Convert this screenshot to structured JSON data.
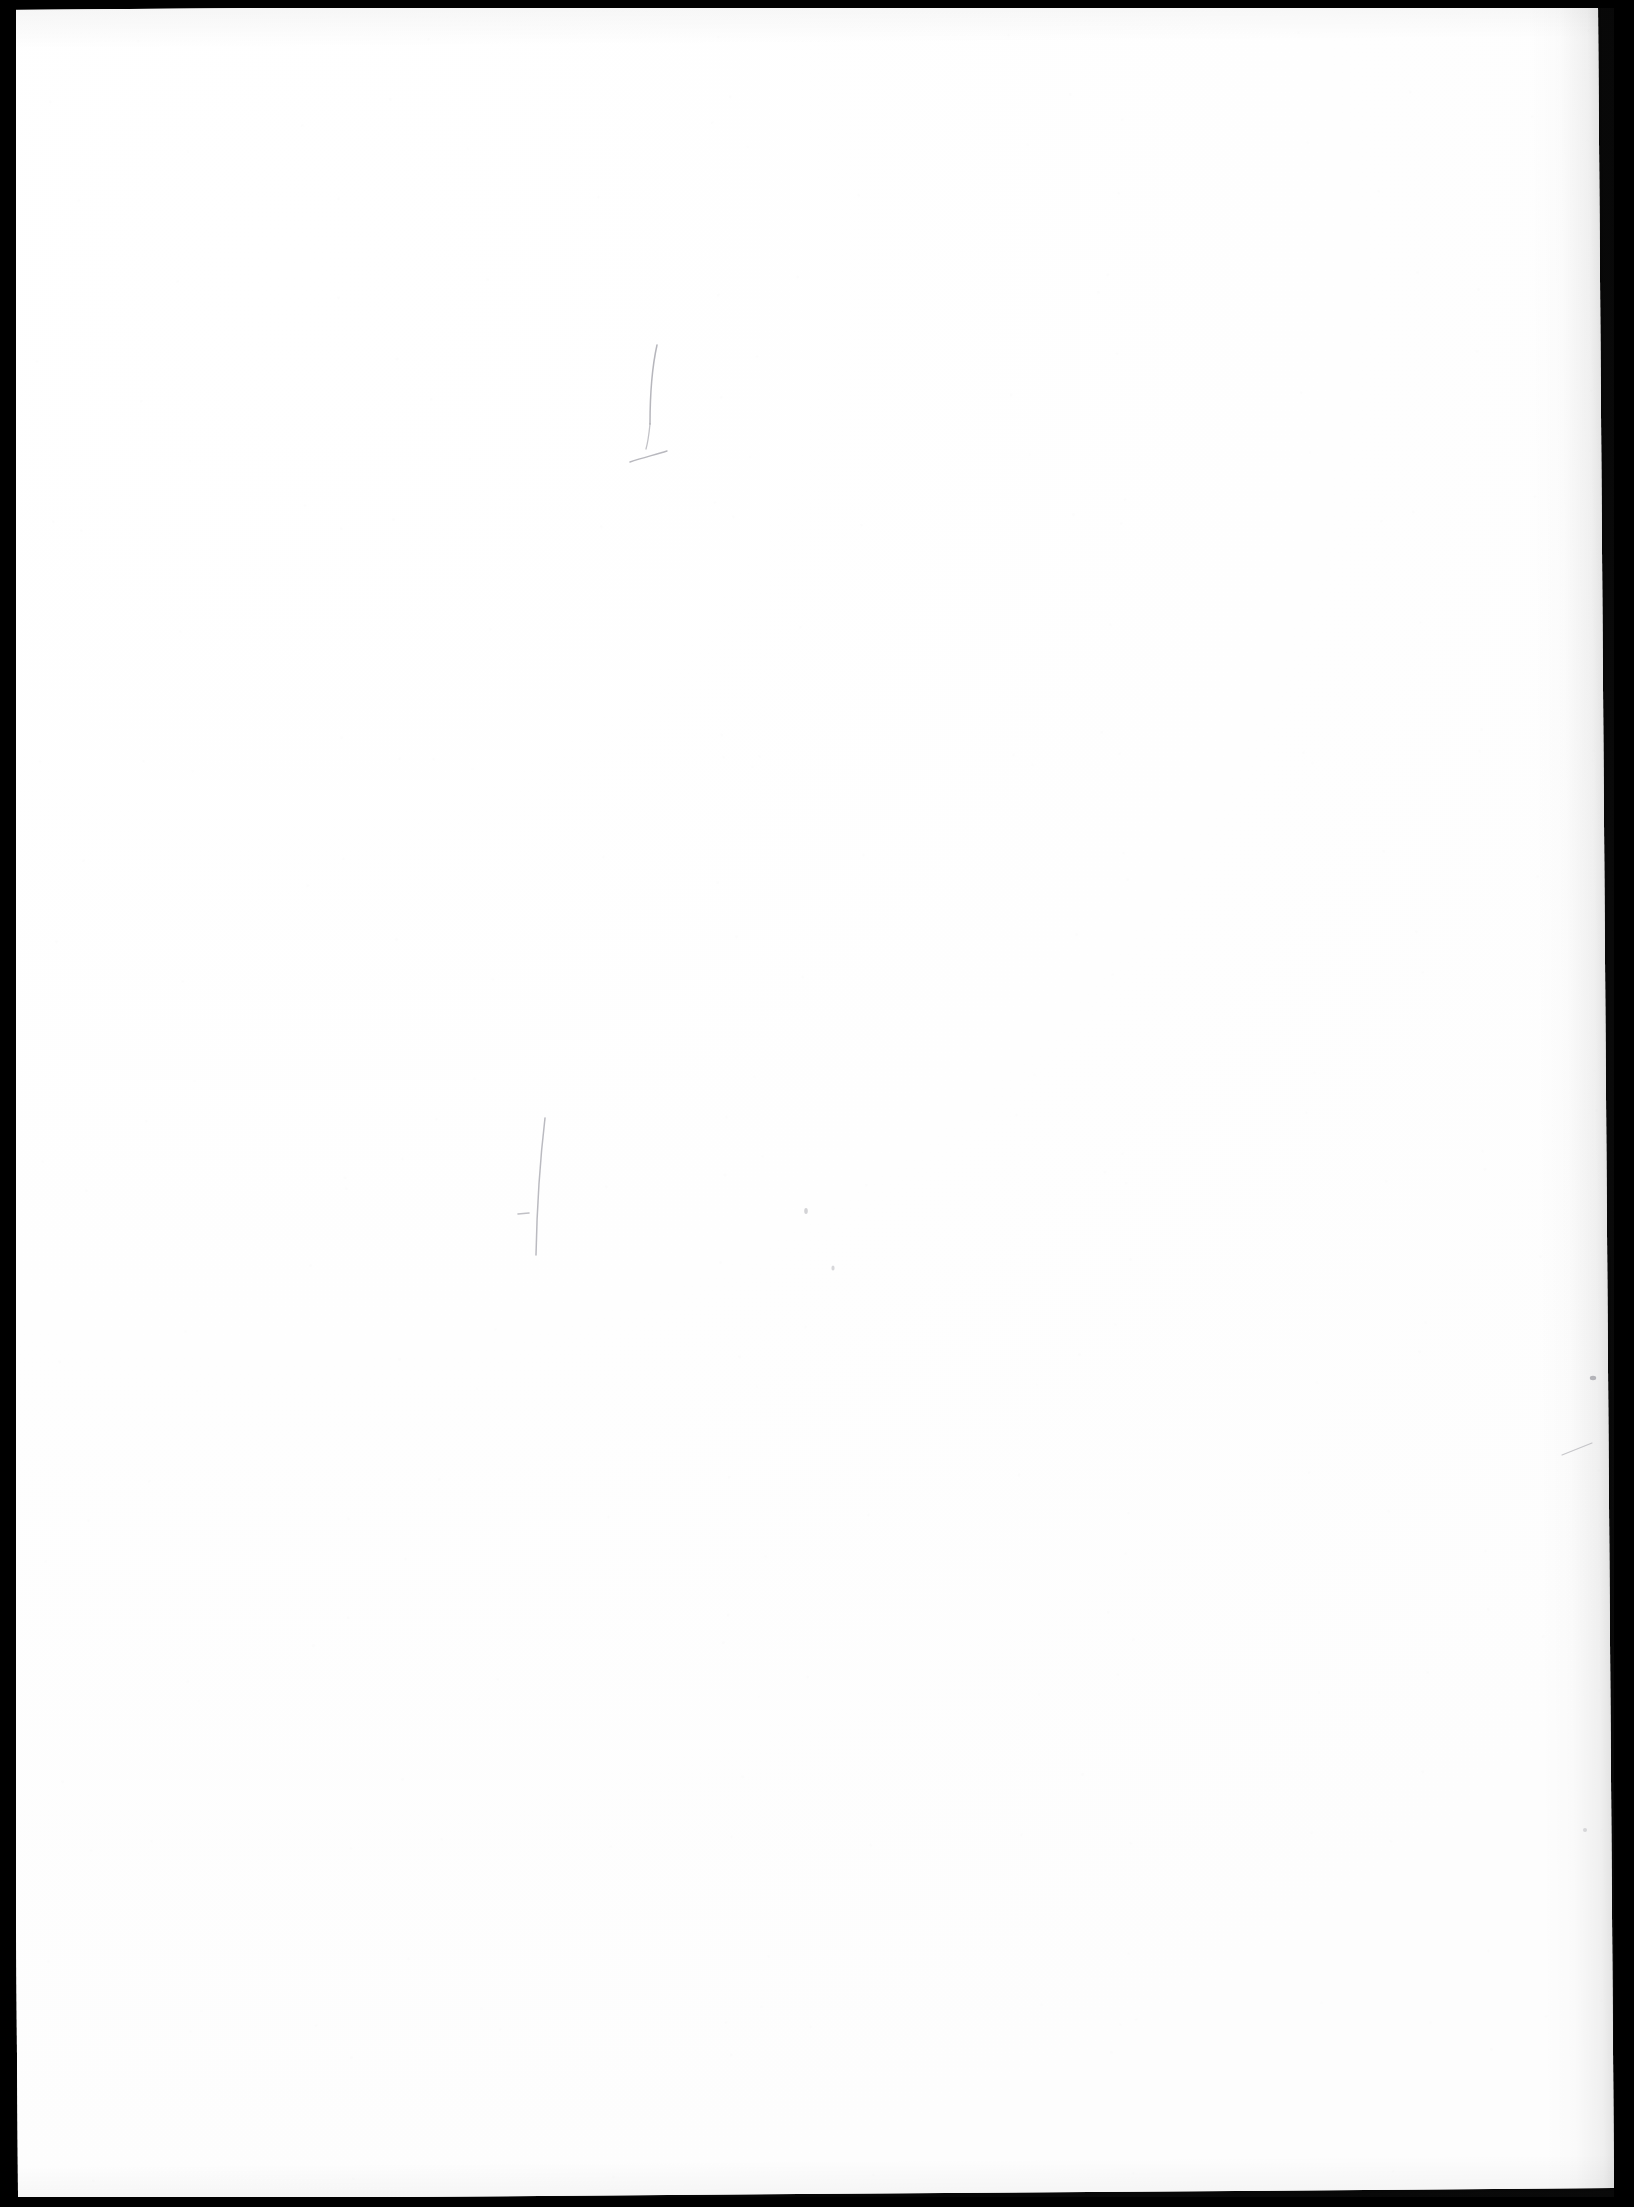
{
  "document": {
    "type": "scanned-page",
    "title": "Blank scanned sheet",
    "visible_text": "",
    "page_content_note": "No printed or legible handwritten text is present on this page.",
    "orientation": "portrait",
    "rotation_degrees": -0.42
  },
  "canvas": {
    "width": 1634,
    "height": 2207
  },
  "paper": {
    "left": 10,
    "top": 4,
    "width": 1596,
    "height": 2190,
    "fill_color": "#ffffff",
    "tone_color": "#fdfdfd"
  },
  "scanner_border": {
    "color": "#000000",
    "left_width": 16,
    "right_width": 20,
    "top_width": 8,
    "bottom_width": 10
  },
  "annotations": {
    "stroke_color": "#9a9aa2",
    "speck_color": "#8e8e96",
    "marks": [
      {
        "name": "upper-vertical-hook-stroke",
        "kind": "stroke",
        "path": "M 657 345 C 651 372, 650 398, 650 424",
        "width": 1.5,
        "opacity": 0.72
      },
      {
        "name": "upper-descender-tail-stroke",
        "kind": "stroke",
        "path": "M 650 424 C 649 434, 648 442, 646 449",
        "width": 1.3,
        "opacity": 0.6
      },
      {
        "name": "upper-horizontal-cross-stroke",
        "kind": "stroke",
        "path": "M 630 462 C 642 458, 654 455, 667 451",
        "width": 1.4,
        "opacity": 0.7
      },
      {
        "name": "lower-long-vertical-stroke",
        "kind": "stroke",
        "path": "M 545 1118 C 540 1160, 537 1205, 536 1255",
        "width": 1.5,
        "opacity": 0.68
      },
      {
        "name": "lower-short-dash-stroke",
        "kind": "stroke",
        "path": "M 518 1214 L 529 1213",
        "width": 1.6,
        "opacity": 0.62
      },
      {
        "name": "right-hairline-diagonal-stroke",
        "kind": "stroke",
        "path": "M 1562 1455 C 1572 1451, 1582 1447, 1592 1443",
        "width": 1.1,
        "opacity": 0.55
      },
      {
        "name": "speck-upper-right",
        "kind": "speck",
        "cx": 1593,
        "cy": 1378,
        "rx": 3.2,
        "ry": 2.2,
        "opacity": 0.62
      },
      {
        "name": "speck-mid-left",
        "kind": "speck",
        "cx": 806,
        "cy": 1211,
        "rx": 1.8,
        "ry": 3.0,
        "opacity": 0.38
      },
      {
        "name": "speck-mid-lower",
        "kind": "speck",
        "cx": 833,
        "cy": 1268,
        "rx": 1.6,
        "ry": 2.6,
        "opacity": 0.34
      },
      {
        "name": "speck-far-right-low",
        "kind": "speck",
        "cx": 1585,
        "cy": 1830,
        "rx": 2.0,
        "ry": 2.0,
        "opacity": 0.3
      }
    ]
  }
}
